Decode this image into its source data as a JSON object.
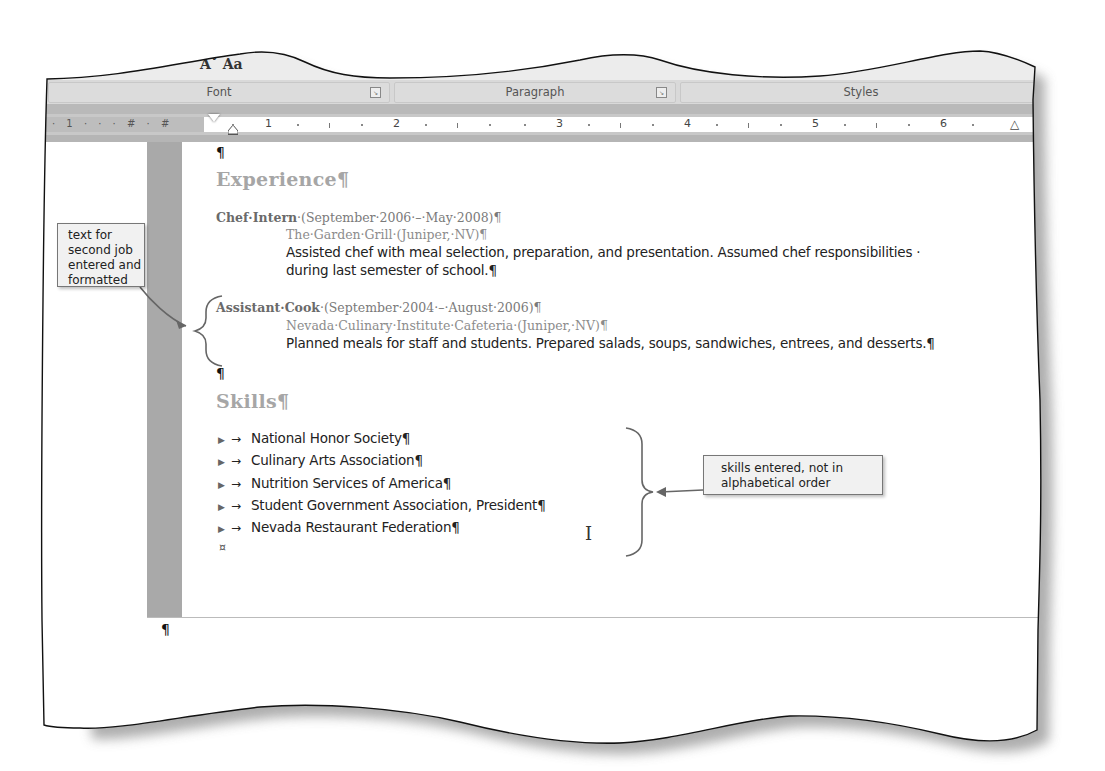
{
  "ribbon": {
    "top_glyphs": "Aˇ Aa",
    "groups": [
      {
        "label": "Font",
        "has_launcher": true
      },
      {
        "label": "Paragraph",
        "has_launcher": true
      },
      {
        "label": "Styles",
        "has_launcher": false
      }
    ],
    "styles_gallery_fragment": "al ...  ‖ Recip"
  },
  "ruler": {
    "left_ticks": "· 1 · · · # · #",
    "numbers": [
      "1",
      "2",
      "3",
      "4",
      "5",
      "6"
    ]
  },
  "document": {
    "empty_paragraph_mark": "¶",
    "experience": {
      "heading": "Experience¶",
      "jobs": [
        {
          "title": "Chef·Intern",
          "dates": "·(September·2006·–·May·2008)¶",
          "employer": "The·Garden·Grill·(Juniper,·NV)¶",
          "description_lines": [
            "Assisted chef with meal selection, preparation, and presentation. Assumed chef responsibilities ·",
            "during last semester of school.¶"
          ]
        },
        {
          "title": "Assistant·Cook",
          "dates": "·(September·2004·–·August·2006)¶",
          "employer": "Nevada·Culinary·Institute·Cafeteria·(Juniper,·NV)¶",
          "description_lines": [
            "Planned meals for staff and students. Prepared salads, soups, sandwiches, entrees, and desserts.¶"
          ]
        }
      ]
    },
    "blank_mark_after_experience": "¶",
    "skills": {
      "heading": "Skills¶",
      "bullet_glyph": "▶",
      "tab_glyph": "→",
      "items": [
        "National Honor Society¶",
        "Culinary Arts Association¶",
        "Nutrition Services of America¶",
        "Student Government Association, President¶",
        "Nevada Restaurant Federation¶"
      ]
    },
    "end_of_cell_mark": "¤",
    "after_table_mark": "¶",
    "ibeam_cursor": "I"
  },
  "callouts": {
    "left": "text for second job entered and formatted",
    "left_lines": [
      "text for",
      "second job",
      "entered and",
      "formatted"
    ],
    "right_lines": [
      "skills entered, not in",
      "alphabetical order"
    ]
  }
}
